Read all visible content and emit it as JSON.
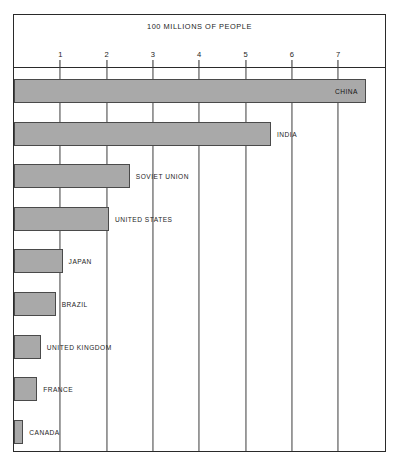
{
  "chart_data": {
    "type": "bar",
    "orientation": "horizontal",
    "title": "100 MILLIONS OF PEOPLE",
    "xlabel": "",
    "ylabel": "",
    "xlim": [
      0,
      8.05
    ],
    "grid": true,
    "legend": null,
    "xticks": [
      "1",
      "2",
      "3",
      "4",
      "5",
      "6",
      "7"
    ],
    "xtick_values": [
      1,
      2,
      3,
      4,
      5,
      6,
      7
    ],
    "categories": [
      "CHINA",
      "INDIA",
      "SOVIET UNION",
      "UNITED STATES",
      "JAPAN",
      "BRAZIL",
      "UNITED KINGDOM",
      "FRANCE",
      "CANADA"
    ],
    "values": [
      7.6,
      5.55,
      2.5,
      2.05,
      1.05,
      0.9,
      0.58,
      0.5,
      0.2
    ],
    "bars": [
      {
        "label": "CHINA",
        "value": 7.6,
        "label_position": "inside"
      },
      {
        "label": "INDIA",
        "value": 5.55,
        "label_position": "outside"
      },
      {
        "label": "SOVIET UNION",
        "value": 2.5,
        "label_position": "outside"
      },
      {
        "label": "UNITED STATES",
        "value": 2.05,
        "label_position": "outside"
      },
      {
        "label": "JAPAN",
        "value": 1.05,
        "label_position": "outside"
      },
      {
        "label": "BRAZIL",
        "value": 0.9,
        "label_position": "outside"
      },
      {
        "label": "UNITED KINGDOM",
        "value": 0.58,
        "label_position": "outside"
      },
      {
        "label": "FRANCE",
        "value": 0.5,
        "label_position": "outside"
      },
      {
        "label": "CANADA",
        "value": 0.2,
        "label_position": "outside"
      }
    ]
  },
  "colors": {
    "bar_fill": "#a9a9a9",
    "bar_border": "#4a4a4a",
    "frame": "#2a2a2a",
    "grid": "#3c3c3c",
    "text": "#1d1d1d",
    "background": "#ffffff"
  }
}
